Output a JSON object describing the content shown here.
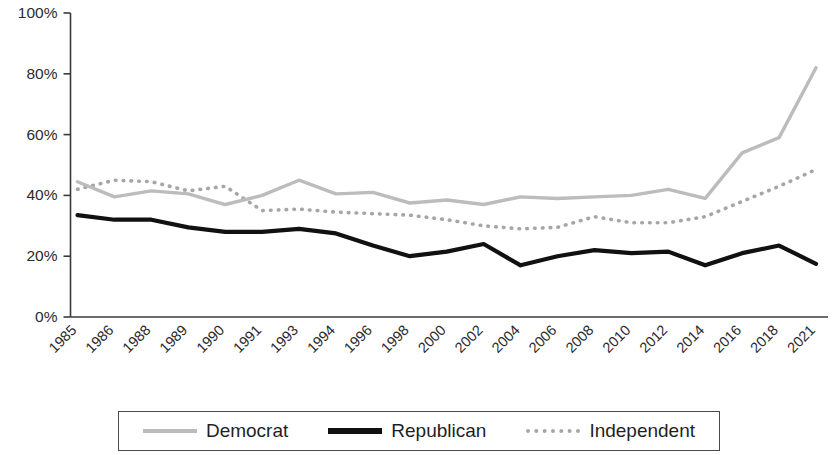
{
  "chart_data": {
    "type": "line",
    "title": "",
    "subtitle": "",
    "xlabel": "",
    "ylabel": "",
    "ylim": [
      0,
      100
    ],
    "grid": false,
    "legend_position": "bottom",
    "y_tick_labels": [
      "100%",
      "80%",
      "60%",
      "40%",
      "20%",
      "0%"
    ],
    "y_tick_values": [
      100,
      80,
      60,
      40,
      20,
      0
    ],
    "categories": [
      "1985",
      "1986",
      "1988",
      "1989",
      "1990",
      "1991",
      "1993",
      "1994",
      "1996",
      "1998",
      "2000",
      "2002",
      "2004",
      "2006",
      "2008",
      "2010",
      "2012",
      "2014",
      "2016",
      "2018",
      "2021"
    ],
    "series": [
      {
        "name": "Democrat",
        "color": "#bcbcbc",
        "style": "solid",
        "values": [
          44.5,
          39.5,
          41.5,
          40.5,
          37.0,
          40.0,
          45.0,
          40.5,
          41.0,
          37.5,
          38.5,
          37.0,
          39.5,
          39.0,
          39.5,
          40.0,
          42.0,
          39.0,
          54.0,
          59.0,
          82.0
        ]
      },
      {
        "name": "Republican",
        "color": "#111111",
        "style": "solid",
        "values": [
          33.5,
          32.0,
          32.0,
          29.5,
          28.0,
          28.0,
          29.0,
          27.5,
          23.5,
          20.0,
          21.5,
          24.0,
          17.0,
          20.0,
          22.0,
          21.0,
          21.5,
          17.0,
          21.0,
          23.5,
          17.5
        ]
      },
      {
        "name": "Independent",
        "color": "#a6a6a6",
        "style": "dotted",
        "values": [
          42.0,
          45.0,
          44.5,
          41.5,
          43.0,
          35.0,
          35.5,
          34.5,
          34.0,
          33.5,
          32.0,
          30.0,
          29.0,
          29.5,
          33.0,
          31.0,
          31.0,
          33.0,
          38.0,
          43.0,
          48.5
        ]
      }
    ]
  },
  "legend": {
    "entries": [
      {
        "label": "Democrat",
        "icon": "line-swatch-solid-gray"
      },
      {
        "label": "Republican",
        "icon": "line-swatch-solid-black"
      },
      {
        "label": "Independent",
        "icon": "line-swatch-dotted-gray"
      }
    ]
  }
}
